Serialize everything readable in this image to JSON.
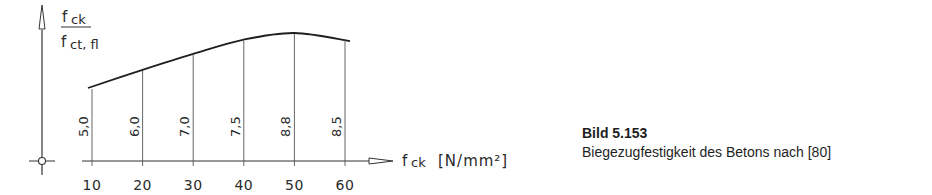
{
  "chart_data": {
    "type": "line",
    "title": "",
    "xlabel": "f_ck [N/mm²]",
    "xlabel_parts": {
      "symbol": "f",
      "sub": "ck",
      "unit": "[N/mm²]"
    },
    "ylabel": "f_ck / f_ct,fl",
    "ylabel_parts": {
      "num_symbol": "f",
      "num_sub": "ck",
      "den_symbol": "f",
      "den_sub": "ct, fl"
    },
    "x": [
      10,
      20,
      30,
      40,
      50,
      60
    ],
    "x_tick_labels": [
      "10",
      "20",
      "30",
      "40",
      "50",
      "60"
    ],
    "series": [
      {
        "name": "f_ck / f_ct,fl",
        "values": [
          5.0,
          6.0,
          7.0,
          7.5,
          8.8,
          8.5
        ]
      }
    ],
    "value_labels": [
      "5,0",
      "6,0",
      "7,0",
      "7,5",
      "8,8",
      "8,5"
    ],
    "curve_relative_height": [
      0.0,
      0.33,
      0.62,
      0.88,
      1.0,
      0.89
    ],
    "xlim": [
      10,
      60
    ],
    "grid": false,
    "legend": "none"
  },
  "caption": {
    "figure_number": "Bild 5.153",
    "title": "Biegezugfestigkeit des Betons nach [80]"
  }
}
